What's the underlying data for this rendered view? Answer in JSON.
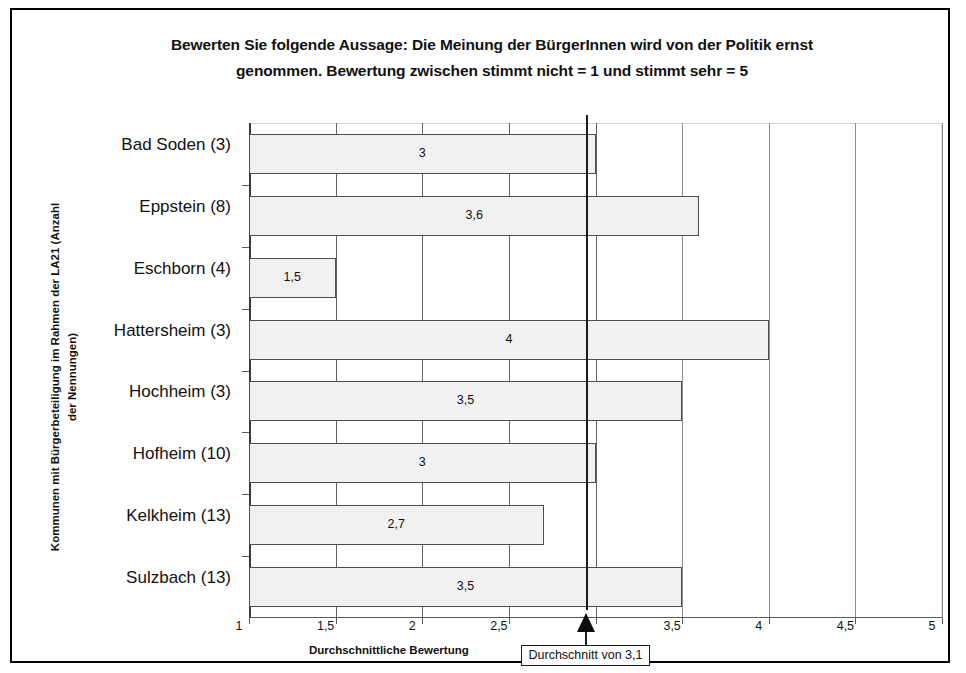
{
  "chart_data": {
    "type": "bar",
    "orientation": "horizontal",
    "title": "Bewerten Sie folgende Aussage: Die Meinung der BürgerInnen wird von der Politik ernst genommen. Bewertung zwischen stimmt nicht = 1 und stimmt sehr = 5",
    "title_lines": [
      "Bewerten Sie folgende Aussage: Die Meinung der BürgerInnen wird von der Politik ernst",
      "genommen. Bewertung zwischen stimmt nicht = 1 und stimmt sehr = 5"
    ],
    "ylabel": "Kommunen mit Bürgerbeteiligung im Rahmen der LA21 (Anzahl der Nennungen)",
    "ylabel_lines": [
      "Kommunen mit Bürgerbeteiligung im Rahmen der LA21 (Anzahl",
      "der Nennungen)"
    ],
    "xlabel": "Durchschnittliche Bewertung",
    "xlim": [
      1,
      5
    ],
    "xticks": [
      1,
      1.5,
      2,
      2.5,
      3,
      3.5,
      4,
      4.5,
      5
    ],
    "xticklabels": [
      "1",
      "1,5",
      "2",
      "2,5",
      "",
      "3,5",
      "4",
      "4,5",
      "5"
    ],
    "grid": true,
    "legend": null,
    "categories": [
      "Bad Soden (3)",
      "Eppstein (8)",
      "Eschborn (4)",
      "Hattersheim (3)",
      "Hochheim (3)",
      "Hofheim (10)",
      "Kelkheim (13)",
      "Sulzbach (13)"
    ],
    "values": [
      3,
      3.6,
      1.5,
      4,
      3.5,
      3,
      2.7,
      3.5
    ],
    "value_labels": [
      "3",
      "3,6",
      "1,5",
      "4",
      "3,5",
      "3",
      "2,7",
      "3,5"
    ],
    "bar_fill_color": "#f1f1f1",
    "bar_border_color": "#4d4d4d",
    "annotation": {
      "text": "Durchschnitt von 3,1",
      "value": 3.1,
      "marker_x": 3.0
    }
  }
}
